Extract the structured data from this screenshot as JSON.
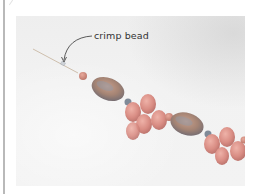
{
  "figure": {
    "callout_label": "crimp bead",
    "colors": {
      "page_background": "#ffffff",
      "left_rule": "#b9b9b9",
      "photo_background": "#f0f0f0",
      "wire": "#c9b9a5",
      "oval_bead": "#a58474",
      "oval_bead_sheen": "#8f9aa8",
      "teardrop_bead": "#d98d84",
      "round_bead": "#d58f82",
      "crimp_bead": "#7f8a98",
      "label_text": "#333333",
      "arrow": "#333333"
    }
  }
}
